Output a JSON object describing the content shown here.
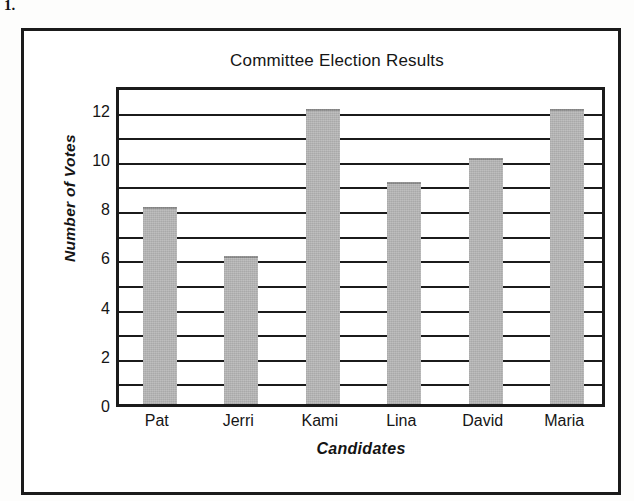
{
  "item_number": "1.",
  "chart_data": {
    "type": "bar",
    "title": "Committee Election Results",
    "xlabel": "Candidates",
    "ylabel": "Number of Votes",
    "categories": [
      "Pat",
      "Jerri",
      "Kami",
      "Lina",
      "David",
      "Maria"
    ],
    "values": [
      8,
      6,
      12,
      9,
      10,
      12
    ],
    "ylim": [
      0,
      13
    ],
    "ytick_values": [
      0,
      2,
      4,
      6,
      8,
      10,
      12
    ],
    "ytick_labels": [
      "0",
      "2",
      "4",
      "6",
      "8",
      "10",
      "12"
    ],
    "gridline_values": [
      1,
      2,
      3,
      4,
      5,
      6,
      7,
      8,
      9,
      10,
      11,
      12
    ],
    "grid": true,
    "legend": false,
    "bar_color": "#b9b9b9",
    "axis_color": "#1b1b1b",
    "background": "#ffffff"
  }
}
